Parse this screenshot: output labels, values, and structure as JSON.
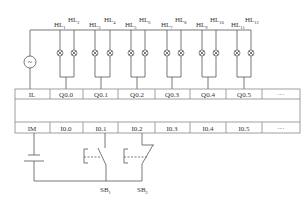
{
  "diagram": {
    "type": "PLC wiring diagram",
    "lamp_labels": [
      {
        "base": "HL",
        "sub": "1"
      },
      {
        "base": "HL",
        "sub": "2"
      },
      {
        "base": "HL",
        "sub": "3"
      },
      {
        "base": "HL",
        "sub": "4"
      },
      {
        "base": "HL",
        "sub": "5"
      },
      {
        "base": "HL",
        "sub": "6"
      },
      {
        "base": "HL",
        "sub": "7"
      },
      {
        "base": "HL",
        "sub": "8"
      },
      {
        "base": "HL",
        "sub": "9"
      },
      {
        "base": "HL",
        "sub": "10"
      },
      {
        "base": "HL",
        "sub": "11"
      },
      {
        "base": "HL",
        "sub": "12"
      }
    ],
    "output_row": [
      "IL",
      "Q0.0",
      "Q0.1",
      "Q0.2",
      "Q0.3",
      "Q0.4",
      "Q0.5",
      "···"
    ],
    "input_row": [
      "IM",
      "I0.0",
      "I0.1",
      "I0.2",
      "I0.3",
      "I0.4",
      "I0.5",
      "···"
    ],
    "switch_labels": [
      {
        "base": "SB",
        "sub": "1"
      },
      {
        "base": "SB",
        "sub": "2"
      }
    ],
    "ac_source_symbol": "~"
  }
}
